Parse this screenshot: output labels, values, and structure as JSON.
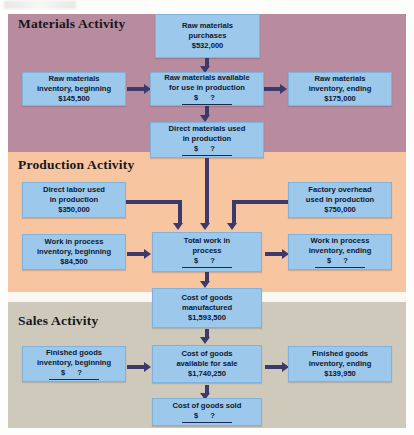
{
  "diagram": {
    "type": "flowchart",
    "bands": [
      {
        "id": "materials",
        "label": "Materials Activity",
        "color": "#b88b9e"
      },
      {
        "id": "production",
        "label": "Production Activity",
        "color": "#f7c5a0"
      },
      {
        "id": "sales",
        "label": "Sales Activity",
        "color": "#cfc9bc"
      }
    ],
    "box_color": "#9cc8ec",
    "arrow_color": "#3b3a6b",
    "blank_marker": "$    ?"
  },
  "boxes": {
    "raw_purchases": {
      "l1": "Raw materials",
      "l2": "purchases",
      "value": "$532,000"
    },
    "raw_beginning": {
      "l1": "Raw materials",
      "l2": "inventory, beginning",
      "value": "$145,500"
    },
    "raw_available": {
      "l1": "Raw materials available",
      "l2": "for use in production",
      "value": "$    ?"
    },
    "raw_ending": {
      "l1": "Raw materials",
      "l2": "inventory, ending",
      "value": "$175,000"
    },
    "direct_materials": {
      "l1": "Direct materials used",
      "l2": "in production",
      "value": "$    ?"
    },
    "direct_labor": {
      "l1": "Direct labor used",
      "l2": "in production",
      "value": "$350,000"
    },
    "factory_overhead": {
      "l1": "Factory overhead",
      "l2": "used in production",
      "value": "$750,000"
    },
    "wip_beginning": {
      "l1": "Work in process",
      "l2": "inventory, beginning",
      "value": "$84,500"
    },
    "total_wip": {
      "l1": "Total work in",
      "l2": "process",
      "value": "$    ?"
    },
    "wip_ending": {
      "l1": "Work in process",
      "l2": "inventory, ending",
      "value": "$    ?"
    },
    "cogm": {
      "l1": "Cost of goods",
      "l2": "manufactured",
      "value": "$1,593,500"
    },
    "fg_beginning": {
      "l1": "Finished goods",
      "l2": "inventory, beginning",
      "value": "$    ?"
    },
    "goods_available": {
      "l1": "Cost of goods",
      "l2": "available for sale",
      "value": "$1,740,250"
    },
    "fg_ending": {
      "l1": "Finished goods",
      "l2": "inventory, ending",
      "value": "$139,950"
    },
    "cogs": {
      "l1": "Cost of goods sold",
      "l2": "",
      "value": "$    ?"
    }
  }
}
